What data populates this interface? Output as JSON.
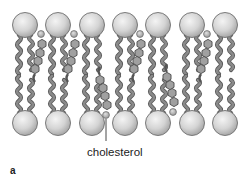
{
  "figure": {
    "panel_label": "a",
    "annotation_label": "cholesterol",
    "colors": {
      "head_fill": "#d8d8d8",
      "head_stroke": "#6e6e6e",
      "tail_fill": "#8a8a8a",
      "tail_stroke": "#555555",
      "sterol_fill": "#a0a0a0",
      "leader_line": "#333333"
    },
    "upper_leaflet": {
      "phospholipid_count": 7,
      "cholesterol_count": 4
    },
    "lower_leaflet": {
      "phospholipid_count": 7,
      "cholesterol_count": 2
    }
  }
}
